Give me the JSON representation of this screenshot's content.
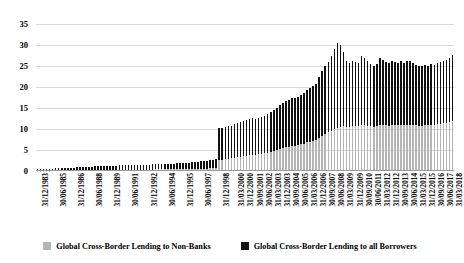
{
  "chart_data": {
    "type": "bar",
    "title": "",
    "subtitle": "",
    "xlabel": "",
    "ylabel": "",
    "ylim": [
      0,
      35
    ],
    "yticks": [
      0,
      5,
      10,
      15,
      20,
      25,
      30,
      35
    ],
    "grid": true,
    "legend_position": "bottom",
    "bar_overlay": "overlapped",
    "categories": [
      "31/12/1983",
      "31/03/1984",
      "30/06/1984",
      "30/09/1984",
      "31/12/1984",
      "31/03/1985",
      "30/06/1985",
      "30/09/1985",
      "31/12/1985",
      "31/03/1986",
      "30/06/1986",
      "30/09/1986",
      "31/12/1986",
      "31/03/1987",
      "30/06/1987",
      "30/09/1987",
      "31/12/1987",
      "31/03/1988",
      "30/06/1988",
      "30/09/1988",
      "31/12/1988",
      "31/03/1989",
      "30/06/1989",
      "30/09/1989",
      "31/12/1989",
      "31/03/1990",
      "30/06/1990",
      "30/09/1990",
      "31/12/1990",
      "31/03/1991",
      "30/06/1991",
      "30/09/1991",
      "31/12/1991",
      "31/03/1992",
      "30/06/1992",
      "30/09/1992",
      "31/12/1992",
      "31/03/1993",
      "30/06/1993",
      "30/09/1993",
      "31/12/1993",
      "31/03/1994",
      "30/06/1994",
      "30/09/1994",
      "31/12/1994",
      "31/03/1995",
      "30/06/1995",
      "30/09/1995",
      "31/12/1995",
      "31/03/1996",
      "30/06/1996",
      "30/09/1996",
      "31/12/1996",
      "31/03/1997",
      "30/06/1997",
      "30/09/1997",
      "31/12/1997",
      "31/03/1998",
      "30/06/1998",
      "30/09/1998",
      "31/12/1998",
      "31/03/1999",
      "30/06/1999",
      "30/09/1999",
      "31/12/1999",
      "31/03/2000",
      "30/06/2000",
      "30/09/2000",
      "31/12/2000",
      "31/03/2001",
      "30/06/2001",
      "30/09/2001",
      "31/12/2001",
      "31/03/2002",
      "30/06/2002",
      "30/09/2002",
      "31/12/2002",
      "31/03/2003",
      "30/06/2003",
      "30/09/2003",
      "31/12/2003",
      "31/03/2004",
      "30/06/2004",
      "30/09/2004",
      "31/12/2004",
      "31/03/2005",
      "30/06/2005",
      "30/09/2005",
      "31/12/2005",
      "31/03/2006",
      "30/06/2006",
      "30/09/2006",
      "31/12/2006",
      "31/03/2007",
      "30/06/2007",
      "30/09/2007",
      "31/12/2007",
      "31/03/2008",
      "30/06/2008",
      "30/09/2008",
      "31/12/2008",
      "31/03/2009",
      "30/06/2009",
      "30/09/2009",
      "31/12/2009",
      "31/03/2010",
      "30/06/2010",
      "30/09/2010",
      "31/12/2010",
      "31/03/2011",
      "30/06/2011",
      "30/09/2011",
      "31/12/2011",
      "31/03/2012",
      "30/06/2012",
      "30/09/2012",
      "31/12/2012",
      "31/03/2013",
      "30/06/2013",
      "30/09/2013",
      "31/12/2013",
      "31/03/2014",
      "30/06/2014",
      "30/09/2014",
      "31/12/2014",
      "31/03/2015",
      "30/06/2015",
      "30/09/2015",
      "31/12/2015",
      "31/03/2016",
      "30/06/2016",
      "30/09/2016",
      "31/12/2016",
      "31/03/2017",
      "30/06/2017",
      "30/09/2017",
      "31/12/2017",
      "31/03/2018"
    ],
    "xtick_labels": [
      "31/12/1983",
      "30/06/1985",
      "31/12/1986",
      "30/06/1988",
      "31/12/1989",
      "30/06/1991",
      "31/12/1992",
      "30/06/1994",
      "31/12/1995",
      "30/06/1997",
      "31/12/1998",
      "31/03/2000",
      "31/12/2000",
      "30/09/2001",
      "30/06/2002",
      "31/03/2003",
      "31/12/2003",
      "30/09/2004",
      "30/06/2005",
      "31/03/2006",
      "31/12/2006",
      "30/09/2007",
      "30/06/2008",
      "31/03/2009",
      "31/12/2009",
      "30/09/2010",
      "30/06/2011",
      "31/03/2012",
      "31/12/2012",
      "30/09/2013",
      "30/06/2014",
      "31/03/2015",
      "31/12/2015",
      "30/09/2016",
      "30/06/2017",
      "31/03/2018"
    ],
    "xtick_indices": [
      0,
      6,
      12,
      18,
      24,
      30,
      36,
      42,
      48,
      54,
      60,
      65,
      68,
      71,
      74,
      77,
      80,
      83,
      86,
      89,
      92,
      95,
      98,
      101,
      104,
      107,
      110,
      113,
      116,
      119,
      122,
      125,
      128,
      131,
      134,
      137
    ],
    "series": [
      {
        "name": "Global Cross-Border Lending to all Borrowers",
        "color": "#111111",
        "values": [
          0.45,
          0.48,
          0.5,
          0.52,
          0.55,
          0.58,
          0.6,
          0.62,
          0.66,
          0.7,
          0.74,
          0.78,
          0.82,
          0.86,
          0.9,
          0.94,
          0.98,
          1.02,
          1.06,
          1.1,
          1.14,
          1.16,
          1.18,
          1.2,
          1.22,
          1.26,
          1.3,
          1.32,
          1.34,
          1.36,
          1.4,
          1.42,
          1.44,
          1.46,
          1.48,
          1.5,
          1.52,
          1.54,
          1.56,
          1.58,
          1.6,
          1.62,
          1.66,
          1.7,
          1.74,
          1.78,
          1.82,
          1.86,
          1.9,
          1.96,
          2.02,
          2.08,
          2.14,
          2.2,
          2.3,
          2.4,
          2.5,
          2.6,
          2.7,
          2.85,
          10.2,
          10.3,
          10.45,
          10.6,
          10.75,
          11.1,
          11.4,
          11.6,
          11.8,
          12.1,
          12.4,
          12.6,
          12.3,
          12.6,
          12.9,
          13.2,
          13.6,
          14.1,
          14.6,
          15.1,
          15.6,
          16.2,
          16.6,
          16.9,
          17.4,
          17.3,
          17.6,
          18.1,
          18.6,
          19.3,
          19.8,
          20.2,
          20.8,
          22.4,
          23.8,
          25.0,
          26.0,
          27.3,
          29.0,
          30.5,
          29.9,
          28.4,
          26.1,
          25.7,
          26.2,
          25.9,
          25.6,
          27.3,
          26.9,
          26.3,
          25.4,
          24.9,
          25.5,
          26.8,
          26.4,
          26.0,
          25.7,
          26.3,
          26.0,
          25.8,
          26.1,
          25.8,
          26.2,
          26.1,
          25.6,
          25.3,
          25.0,
          24.9,
          25.2,
          25.0,
          25.4,
          25.3,
          25.6,
          25.9,
          26.2,
          26.5,
          27.0,
          27.6
        ]
      },
      {
        "name": "Global Cross-Border Lending to Non-Banks",
        "color": "#b5b5b5",
        "values": [
          0.1,
          0.11,
          0.11,
          0.12,
          0.12,
          0.13,
          0.13,
          0.14,
          0.15,
          0.15,
          0.16,
          0.17,
          0.18,
          0.19,
          0.2,
          0.21,
          0.22,
          0.23,
          0.24,
          0.25,
          0.26,
          0.26,
          0.27,
          0.27,
          0.28,
          0.29,
          0.3,
          0.3,
          0.31,
          0.31,
          0.32,
          0.33,
          0.33,
          0.34,
          0.34,
          0.35,
          0.35,
          0.36,
          0.36,
          0.37,
          0.37,
          0.38,
          0.39,
          0.4,
          0.41,
          0.42,
          0.43,
          0.44,
          0.45,
          0.46,
          0.48,
          0.49,
          0.5,
          0.52,
          0.54,
          0.56,
          0.58,
          0.6,
          0.62,
          0.65,
          2.6,
          2.7,
          2.8,
          2.9,
          3.0,
          3.15,
          3.3,
          3.4,
          3.5,
          3.65,
          3.8,
          3.9,
          3.85,
          3.95,
          4.1,
          4.25,
          4.4,
          4.6,
          4.8,
          5.0,
          5.2,
          5.45,
          5.6,
          5.75,
          5.95,
          6.0,
          6.15,
          6.35,
          6.55,
          6.8,
          7.0,
          7.2,
          7.45,
          7.9,
          8.35,
          8.8,
          9.2,
          9.6,
          10.0,
          10.3,
          10.5,
          10.6,
          10.5,
          10.55,
          10.7,
          10.65,
          10.6,
          10.9,
          10.85,
          10.75,
          10.6,
          10.5,
          10.7,
          10.95,
          10.9,
          10.85,
          10.8,
          10.95,
          10.9,
          10.85,
          10.95,
          10.9,
          11.0,
          11.0,
          10.9,
          10.85,
          10.8,
          10.8,
          10.9,
          10.85,
          11.0,
          11.0,
          11.1,
          11.2,
          11.35,
          11.5,
          11.7,
          11.9
        ]
      }
    ]
  },
  "legend": {
    "items": [
      {
        "label": "Global Cross-Border Lending to Non-Banks",
        "swatch": "gray-swatch"
      },
      {
        "label": "Global Cross-Border Lending to all Borrowers",
        "swatch": "black-swatch"
      }
    ]
  }
}
